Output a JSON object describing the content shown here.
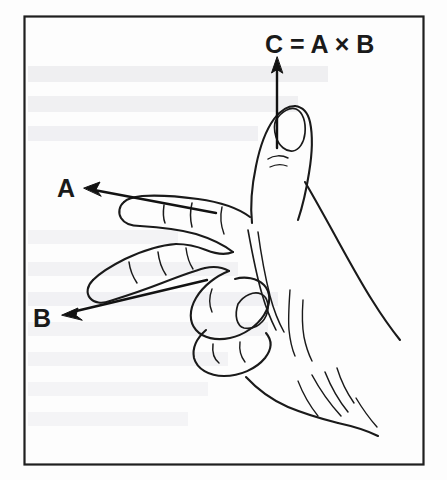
{
  "figure": {
    "kind": "line-drawing",
    "caption_text": "",
    "frame": {
      "visible": true,
      "stroke_color": "#1f1f1f",
      "fill_color": "#ffffff",
      "x": 24,
      "y": 16,
      "width": 400,
      "height": 449
    },
    "background_color": "#fdfdfd",
    "ink_color": "#1a1a1a"
  },
  "labels": {
    "vector_a": "A",
    "vector_b": "B",
    "vector_c": "C = A × B"
  },
  "vectors": [
    {
      "name": "A",
      "label": "A",
      "label_x": 60,
      "label_y": 196,
      "tip_x": 85,
      "tip_y": 188,
      "tail_x": 215,
      "tail_y": 212,
      "direction": "left",
      "described_by": "index-finger"
    },
    {
      "name": "B",
      "label": "B",
      "label_x": 36,
      "label_y": 326,
      "tip_x": 62,
      "tip_y": 316,
      "tail_x": 205,
      "tail_y": 281,
      "direction": "down-left",
      "described_by": "middle-finger"
    },
    {
      "name": "C",
      "label": "C = A × B",
      "label_x": 265,
      "label_y": 52,
      "tip_x": 277,
      "tip_y": 60,
      "tail_x": 277,
      "tail_y": 148,
      "direction": "up",
      "described_by": "thumb"
    }
  ],
  "bleed_through_text": [
    {
      "text": "",
      "x": 30,
      "y": 82
    },
    {
      "text": "",
      "x": 30,
      "y": 112
    },
    {
      "text": "",
      "x": 30,
      "y": 142
    }
  ],
  "colors": {
    "ink": "#1a1a1a",
    "frame": "#1f1f1f",
    "paper": "#fdfdfd",
    "bleed": "#d9d9dc"
  }
}
